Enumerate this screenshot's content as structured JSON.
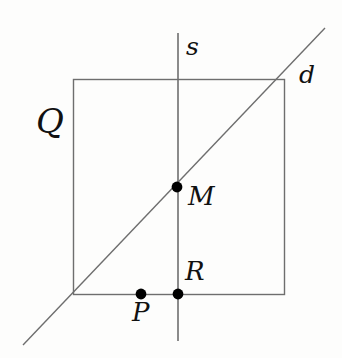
{
  "figure": {
    "type": "geometry-diagram",
    "background_color": "#fdfdfc",
    "line_color": "#6e6e6e",
    "point_color": "#000000",
    "label_color": "#111111",
    "canvas": {
      "width": 342,
      "height": 358
    }
  },
  "shapes": {
    "square": {
      "name": "Q",
      "x": 73,
      "y": 79,
      "width": 211,
      "height": 215,
      "corners": [
        [
          73,
          79
        ],
        [
          284,
          79
        ],
        [
          284,
          294
        ],
        [
          73,
          294
        ]
      ]
    },
    "line_s": {
      "name": "s",
      "orientation": "vertical",
      "x1": 178,
      "y1": 33,
      "x2": 178,
      "y2": 341
    },
    "line_d": {
      "name": "d",
      "orientation": "diagonal",
      "x1": 23,
      "y1": 345,
      "x2": 325,
      "y2": 28
    }
  },
  "points": [
    {
      "label": "M",
      "x": 177,
      "y": 187,
      "radius": 5,
      "on": "intersection of s and d"
    },
    {
      "label": "R",
      "x": 178,
      "y": 294,
      "radius": 5,
      "on": "intersection of s and bottom side"
    },
    {
      "label": "P",
      "x": 141,
      "y": 294,
      "radius": 5,
      "on": "bottom side"
    }
  ],
  "labels": {
    "square": "Q",
    "vertical_line": "s",
    "diagonal_line": "d",
    "midpoint": "M",
    "foot": "R",
    "point": "P"
  }
}
